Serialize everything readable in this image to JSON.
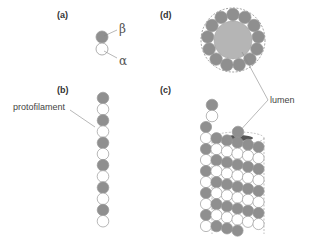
{
  "figure": {
    "panels": {
      "a": {
        "label": "(a)",
        "beta_label": "β",
        "alpha_label": "α"
      },
      "b": {
        "label": "(b)",
        "callout": "protofilament",
        "pairs": 6
      },
      "c": {
        "label": "(c)",
        "callout": "lumen"
      },
      "d": {
        "label": "(d)",
        "subunits": 13
      }
    },
    "colors": {
      "beta": "#8f8f8f",
      "alpha": "#ffffff",
      "outline": "#9a9a9a",
      "lumen": "#b5b5b5",
      "leader": "#888888"
    }
  }
}
